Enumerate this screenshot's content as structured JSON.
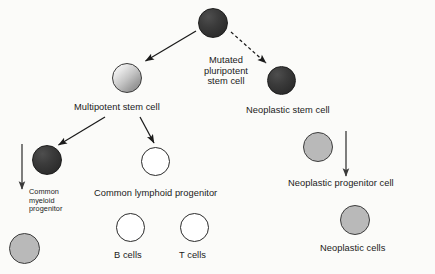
{
  "diagram": {
    "background_color": "#fbfbf9",
    "labels": {
      "mutated_pluripotent_stem_cell": "Mutated\npluripotent\nstem cell",
      "mutated_pluripotent_line_1": "Mutated",
      "mutated_pluripotent_line_2": "pluripotent",
      "mutated_pluripotent_line_3": "stem cell",
      "multipotent_stem_cell": "Multipotent stem cell",
      "neoplastic_stem_cell": "Neoplastic stem cell",
      "common_myeloid_progenitor_line_1": "Common",
      "common_myeloid_progenitor_line_2": "myeloid",
      "common_myeloid_progenitor_line_3": "progenitor",
      "common_lymphoid_progenitor": "Common lymphoid progenitor",
      "b_cells": "B cells",
      "t_cells": "T cells",
      "neoplastic_progenitor_cell": "Neoplastic progenitor cell",
      "neoplastic_cells": "Neoplastic cells"
    },
    "cells": [
      {
        "name": "mutated-pluripotent-stem-cell-circle",
        "style": "dark",
        "x": 198,
        "y": 8,
        "diameter": 30,
        "fill": "#353535"
      },
      {
        "name": "multipotent-stem-cell-circle",
        "style": "gradient-light",
        "x": 112,
        "y": 63,
        "diameter": 30,
        "fill": "#d0d0d0"
      },
      {
        "name": "neoplastic-stem-cell-circle",
        "style": "dark",
        "x": 267,
        "y": 66,
        "diameter": 29,
        "fill": "#333333"
      },
      {
        "name": "common-myeloid-progenitor-circle",
        "style": "dark",
        "x": 32,
        "y": 145,
        "diameter": 30,
        "fill": "#454545"
      },
      {
        "name": "common-lymphoid-progenitor-circle",
        "style": "white",
        "x": 141,
        "y": 147,
        "diameter": 29,
        "fill": "#ffffff"
      },
      {
        "name": "neoplastic-progenitor-cell-circle",
        "style": "gray",
        "x": 303,
        "y": 132,
        "diameter": 30,
        "fill": "#b9b9b9"
      },
      {
        "name": "myeloid-derived-cell-circle",
        "style": "gray",
        "x": 9,
        "y": 233,
        "diameter": 31,
        "fill": "#a8a8a8"
      },
      {
        "name": "b-cells-circle",
        "style": "white",
        "x": 116,
        "y": 213,
        "diameter": 29,
        "fill": "#ffffff"
      },
      {
        "name": "t-cells-circle",
        "style": "white",
        "x": 180,
        "y": 213,
        "diameter": 29,
        "fill": "#ffffff"
      },
      {
        "name": "neoplastic-cells-circle",
        "style": "gray",
        "x": 340,
        "y": 205,
        "diameter": 30,
        "fill": "#b9b9b9"
      }
    ],
    "arrows": [
      {
        "name": "arrow-pluripotent-to-multipotent",
        "style": "solid",
        "from": [
          195,
          30
        ],
        "to": [
          143,
          62
        ],
        "stroke": "#1a1a1a"
      },
      {
        "name": "arrow-pluripotent-to-neoplastic",
        "style": "dashed",
        "from": [
          232,
          33
        ],
        "to": [
          268,
          64
        ],
        "stroke": "#1a1a1a"
      },
      {
        "name": "arrow-multipotent-to-myeloid",
        "style": "solid",
        "from": [
          104,
          118
        ],
        "to": [
          57,
          146
        ],
        "stroke": "#1a1a1a"
      },
      {
        "name": "arrow-multipotent-to-lymphoid",
        "style": "solid",
        "from": [
          140,
          118
        ],
        "to": [
          155,
          145
        ],
        "stroke": "#1a1a1a"
      },
      {
        "name": "arrow-myeloid-lineage-down",
        "style": "solid-vertical",
        "from": [
          22,
          144
        ],
        "to": [
          22,
          190
        ],
        "stroke": "#3a3a3a"
      },
      {
        "name": "arrow-neoplastic-lineage-down",
        "style": "solid-vertical",
        "from": [
          346,
          131
        ],
        "to": [
          346,
          177
        ],
        "stroke": "#3a3a3a"
      }
    ],
    "colors": {
      "ink": "#1a1a1a",
      "dark_cell": "#333333",
      "gray_cell": "#b9b9b9",
      "white_cell": "#ffffff",
      "arrow": "#1a1a1a"
    }
  }
}
